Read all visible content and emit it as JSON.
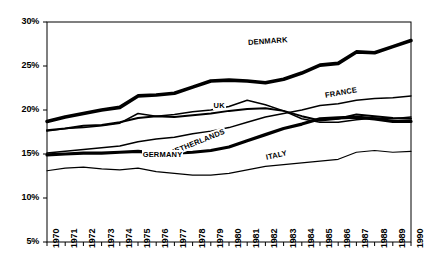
{
  "chart_data": {
    "type": "line",
    "title": "",
    "subtitle": "",
    "xlabel": "",
    "ylabel": "",
    "grid": false,
    "legend_position": "inline-labels",
    "x": [
      1970,
      1971,
      1972,
      1973,
      1974,
      1975,
      1976,
      1977,
      1978,
      1979,
      1980,
      1981,
      1982,
      1983,
      1984,
      1985,
      1986,
      1987,
      1988,
      1989,
      1990
    ],
    "xlim": [
      1970,
      1990
    ],
    "ylim": [
      5,
      30
    ],
    "ytick_labels": [
      "30%",
      "25%",
      "20%",
      "15%",
      "10%",
      "5%"
    ],
    "ytick_values": [
      30,
      25,
      20,
      15,
      10,
      5
    ],
    "xtick_labels": [
      "1970",
      "1971",
      "1972",
      "1973",
      "1974",
      "1975",
      "1976",
      "1977",
      "1978",
      "1979",
      "1980",
      "1981",
      "1982",
      "1983",
      "1984",
      "1985",
      "1986",
      "1987",
      "1988",
      "1989",
      "1990"
    ],
    "series": [
      {
        "name": "DENMARK",
        "label": "DENMARK",
        "width": 3.6,
        "color": "#000000",
        "label_x": 1981.0,
        "label_y": 27.6,
        "label_rotate": -4,
        "values": [
          18.7,
          19.2,
          19.6,
          20.0,
          20.3,
          21.6,
          21.7,
          21.9,
          22.6,
          23.3,
          23.4,
          23.3,
          23.1,
          23.5,
          24.2,
          25.1,
          25.3,
          26.6,
          26.5,
          27.2,
          27.9
        ]
      },
      {
        "name": "UK",
        "label": "UK",
        "width": 2.0,
        "color": "#000000",
        "label_x": 1979.1,
        "label_y": 20.5,
        "label_rotate": 0,
        "values": [
          17.7,
          17.9,
          18.2,
          18.3,
          18.6,
          19.1,
          19.3,
          19.2,
          19.4,
          19.6,
          19.9,
          20.1,
          20.2,
          19.9,
          19.3,
          18.8,
          19.0,
          19.5,
          19.3,
          19.1,
          19.0
        ]
      },
      {
        "name": "FRANCE",
        "label": "FRANCE",
        "width": 1.5,
        "color": "#000000",
        "label_x": 1985.2,
        "label_y": 21.6,
        "label_rotate": -10,
        "values": [
          15.1,
          15.3,
          15.5,
          15.7,
          15.9,
          16.4,
          16.7,
          16.9,
          17.3,
          17.6,
          18.0,
          18.6,
          19.2,
          19.6,
          20.0,
          20.5,
          20.7,
          21.1,
          21.3,
          21.4,
          21.6
        ]
      },
      {
        "name": "NETHERLANDS",
        "label": "NETHERLANDS",
        "width": 1.5,
        "color": "#000000",
        "label_x": 1976.7,
        "label_y": 15.0,
        "label_rotate": -22,
        "values": [
          17.6,
          17.9,
          18.0,
          18.2,
          18.5,
          19.6,
          19.3,
          19.5,
          19.8,
          20.0,
          20.4,
          21.1,
          20.6,
          19.9,
          19.0,
          18.6,
          18.6,
          18.9,
          19.1,
          19.0,
          19.2
        ]
      },
      {
        "name": "GERMANY",
        "label": "GERMANY",
        "width": 3.2,
        "color": "#000000",
        "label_x": 1975.2,
        "label_y": 14.9,
        "label_rotate": 0,
        "values": [
          14.9,
          15.0,
          15.1,
          15.1,
          15.2,
          15.3,
          15.1,
          15.1,
          15.2,
          15.4,
          15.8,
          16.5,
          17.2,
          17.9,
          18.4,
          19.0,
          19.1,
          19.2,
          19.0,
          18.7,
          18.7
        ]
      },
      {
        "name": "ITALY",
        "label": "ITALY",
        "width": 1.2,
        "color": "#000000",
        "label_x": 1982.0,
        "label_y": 14.6,
        "label_rotate": -12,
        "values": [
          13.1,
          13.4,
          13.5,
          13.3,
          13.2,
          13.4,
          13.0,
          12.8,
          12.6,
          12.6,
          12.8,
          13.2,
          13.6,
          13.8,
          14.0,
          14.2,
          14.4,
          15.2,
          15.4,
          15.2,
          15.3
        ]
      }
    ]
  },
  "plot": {
    "left": 47,
    "right": 411,
    "top": 22,
    "bottom": 242,
    "border_color": "#000000"
  }
}
